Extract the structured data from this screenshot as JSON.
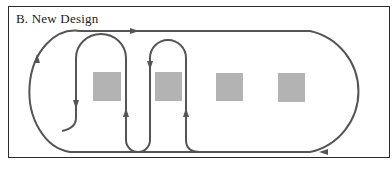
{
  "figure": {
    "title": "B.  New Design"
  },
  "colors": {
    "path": "#555555",
    "station": "#b3b3b3",
    "border": "#2a2a2a",
    "background": "#ffffff"
  },
  "stations": [
    {
      "id": "station-1",
      "x": 93,
      "y": 72,
      "w": 28,
      "h": 29
    },
    {
      "id": "station-2",
      "x": 155,
      "y": 72,
      "w": 27,
      "h": 29
    },
    {
      "id": "station-3",
      "x": 216,
      "y": 73,
      "w": 27,
      "h": 28
    },
    {
      "id": "station-4",
      "x": 278,
      "y": 73,
      "w": 27,
      "h": 29
    }
  ]
}
